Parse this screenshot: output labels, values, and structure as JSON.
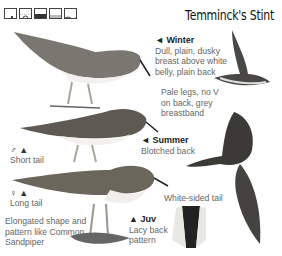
{
  "page": {
    "title": "Temminck's Stint",
    "habitat_icons": [
      "shore-icon",
      "sun-open-icon",
      "wetland-icon",
      "marsh-icon",
      "water-icon"
    ]
  },
  "annotations": {
    "winter": {
      "heading": "◄ Winter",
      "text": [
        "Dull, plain, dusky",
        "breast above white",
        "belly, plain back"
      ]
    },
    "legs": {
      "text": [
        "Pale legs, no V",
        "on back, grey",
        "breastband"
      ]
    },
    "summer": {
      "heading": "◄ Summer",
      "text": [
        "Blotched back"
      ]
    },
    "male": {
      "symbol": "♂ ▲",
      "text": [
        "Short tail"
      ]
    },
    "female": {
      "symbol": "♀ ▲",
      "text": [
        "Long tail"
      ]
    },
    "shape": {
      "text": [
        "Elongated shape and",
        "pattern like Common",
        "Sandpiper"
      ]
    },
    "juv": {
      "heading": "▲ Juv",
      "text": [
        "Lacy back",
        "pattern"
      ]
    },
    "tail": {
      "text": [
        "White-sided tail"
      ]
    }
  },
  "colors": {
    "ink": "#222222",
    "label": "#666666",
    "bird_dark": "#5a5a55",
    "bird_mid": "#8a8780",
    "bird_light": "#d8d6d0"
  }
}
